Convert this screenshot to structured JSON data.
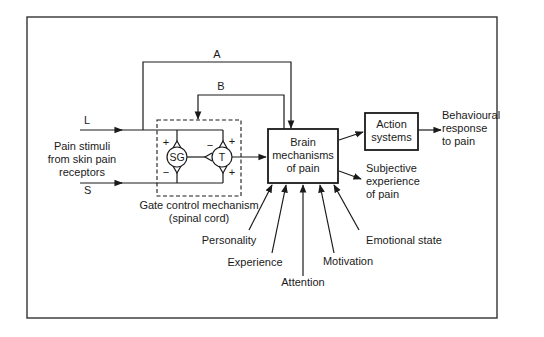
{
  "diagram": {
    "paths": {
      "A": "A",
      "B": "B"
    },
    "inputs": {
      "L": "L",
      "S": "S",
      "stimulus_label": [
        "Pain stimuli",
        "from skin pain",
        "receptors"
      ]
    },
    "gate": {
      "sg_label": "SG",
      "t_label": "T",
      "caption": [
        "Gate control mechanism",
        "(spinal cord)"
      ],
      "signs": {
        "sg_top": "+",
        "sg_bottom": "−",
        "t_left": "−",
        "t_top": "+",
        "t_bottom": "+"
      }
    },
    "brain_box": [
      "Brain",
      "mechanisms",
      "of pain"
    ],
    "action_box": [
      "Action",
      "systems"
    ],
    "outputs": {
      "behavioural": [
        "Behavioural",
        "response",
        "to pain"
      ],
      "subjective": [
        "Subjective",
        "experience",
        "of pain"
      ]
    },
    "influences": [
      {
        "label": "Personality"
      },
      {
        "label": "Experience"
      },
      {
        "label": "Attention"
      },
      {
        "label": "Motivation"
      },
      {
        "label": "Emotional state"
      }
    ]
  }
}
